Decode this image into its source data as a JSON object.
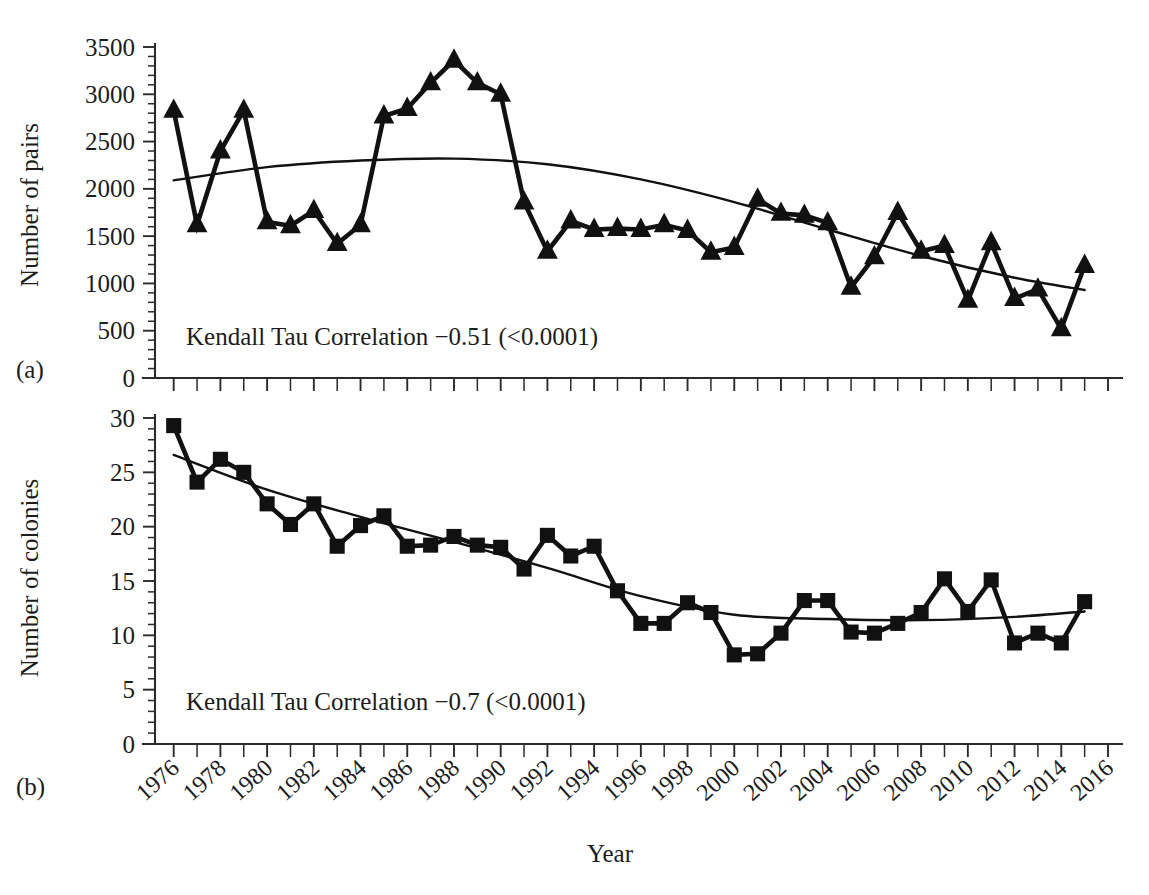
{
  "figure": {
    "panel_a_label": "(a)",
    "panel_b_label": "(b)",
    "xaxis_title": "Year"
  },
  "chart_data": [
    {
      "type": "line",
      "panel": "(a)",
      "title": "",
      "xlabel": "Year",
      "ylabel": "Number of pairs",
      "ylim": [
        0,
        3500
      ],
      "yticks": [
        0,
        500,
        1000,
        1500,
        2000,
        2500,
        3000,
        3500
      ],
      "ytick_labels": [
        "0",
        "500",
        "1000",
        "1500",
        "2000",
        "2500",
        "3000",
        "3500"
      ],
      "xlim": [
        1975.2,
        2016.6
      ],
      "xticks": [
        1976,
        1978,
        1980,
        1982,
        1984,
        1986,
        1988,
        1990,
        1992,
        1994,
        1996,
        1998,
        2000,
        2002,
        2004,
        2006,
        2008,
        2010,
        2012,
        2014,
        2016
      ],
      "xtick_labels": [
        "1976",
        "1978",
        "1980",
        "1982",
        "1984",
        "1986",
        "1988",
        "1990",
        "1992",
        "1994",
        "1996",
        "1998",
        "2000",
        "2002",
        "2004",
        "2006",
        "2008",
        "2010",
        "2012",
        "2014",
        "2016"
      ],
      "grid": false,
      "legend": "none",
      "marker": "triangle",
      "annotation": "Kendall Tau Correlation −0.51 (<0.0001)",
      "x": [
        1976,
        1977,
        1978,
        1979,
        1980,
        1981,
        1982,
        1983,
        1984,
        1985,
        1986,
        1987,
        1988,
        1989,
        1990,
        1991,
        1992,
        1993,
        1994,
        1995,
        1996,
        1997,
        1998,
        1999,
        2000,
        2001,
        2002,
        2003,
        2004,
        2005,
        2006,
        2007,
        2008,
        2009,
        2010,
        2011,
        2012,
        2013,
        2014,
        2015
      ],
      "values": [
        2830,
        1620,
        2400,
        2830,
        1650,
        1610,
        1770,
        1420,
        1620,
        2770,
        2850,
        3120,
        3360,
        3120,
        3000,
        1860,
        1340,
        1660,
        1570,
        1580,
        1570,
        1620,
        1560,
        1330,
        1380,
        1890,
        1740,
        1720,
        1640,
        960,
        1280,
        1750,
        1340,
        1400,
        820,
        1430,
        840,
        940,
        520,
        1190
      ],
      "trend": {
        "name": "LOESS trend",
        "x": [
          1976,
          1980,
          1984,
          1988,
          1992,
          1996,
          2000,
          2004,
          2008,
          2012,
          2015
        ],
        "values": [
          2090,
          2230,
          2300,
          2320,
          2260,
          2100,
          1860,
          1570,
          1290,
          1060,
          930
        ]
      }
    },
    {
      "type": "line",
      "panel": "(b)",
      "title": "",
      "xlabel": "Year",
      "ylabel": "Number of colonies",
      "ylim": [
        0,
        30
      ],
      "yticks": [
        0,
        5,
        10,
        15,
        20,
        25,
        30
      ],
      "ytick_labels": [
        "0",
        "5",
        "10",
        "15",
        "20",
        "25",
        "30"
      ],
      "xlim": [
        1975.2,
        2016.6
      ],
      "xticks": [
        1976,
        1978,
        1980,
        1982,
        1984,
        1986,
        1988,
        1990,
        1992,
        1994,
        1996,
        1998,
        2000,
        2002,
        2004,
        2006,
        2008,
        2010,
        2012,
        2014,
        2016
      ],
      "xtick_labels": [
        "1976",
        "1978",
        "1980",
        "1982",
        "1984",
        "1986",
        "1988",
        "1990",
        "1992",
        "1994",
        "1996",
        "1998",
        "2000",
        "2002",
        "2004",
        "2006",
        "2008",
        "2010",
        "2012",
        "2014",
        "2016"
      ],
      "grid": false,
      "legend": "none",
      "marker": "square",
      "annotation": "Kendall Tau Correlation −0.7 (<0.0001)",
      "x": [
        1976,
        1977,
        1978,
        1979,
        1980,
        1981,
        1982,
        1983,
        1984,
        1985,
        1986,
        1987,
        1988,
        1989,
        1990,
        1991,
        1992,
        1993,
        1994,
        1995,
        1996,
        1997,
        1998,
        1999,
        2000,
        2001,
        2002,
        2003,
        2004,
        2005,
        2006,
        2007,
        2008,
        2009,
        2010,
        2011,
        2012,
        2013,
        2014,
        2015
      ],
      "values": [
        29.3,
        24.1,
        26.2,
        25.0,
        22.1,
        20.2,
        22.1,
        18.2,
        20.1,
        21.0,
        18.2,
        18.3,
        19.1,
        18.3,
        18.1,
        16.1,
        19.2,
        17.3,
        18.2,
        14.1,
        11.1,
        11.1,
        13.0,
        12.1,
        8.2,
        8.3,
        10.2,
        13.2,
        13.2,
        10.3,
        10.2,
        11.1,
        12.1,
        15.2,
        12.2,
        15.1,
        9.3,
        10.2,
        9.3,
        13.1
      ],
      "trend": {
        "name": "LOESS trend",
        "x": [
          1976,
          1980,
          1984,
          1988,
          1992,
          1996,
          2000,
          2004,
          2008,
          2012,
          2015
        ],
        "values": [
          26.6,
          23.4,
          20.9,
          18.6,
          16.2,
          13.6,
          11.9,
          11.5,
          11.4,
          11.7,
          12.2
        ]
      }
    }
  ]
}
